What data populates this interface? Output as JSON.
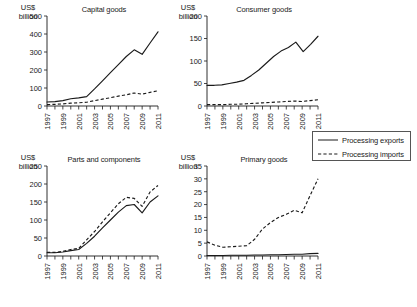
{
  "figure": {
    "unit_label": "US$\nbillion",
    "legend": {
      "exports_label": "Processing exports",
      "imports_label": "Processing imports",
      "exports_style": "solid",
      "imports_style": "dashed",
      "position": "right-middle"
    },
    "line_color": "#1a1a1a",
    "background": "#ffffff"
  },
  "chart_data": [
    {
      "type": "line",
      "title": "Capital goods",
      "xlabel": "",
      "ylabel": "US$ billion",
      "x": [
        1997,
        1998,
        1999,
        2000,
        2001,
        2002,
        2003,
        2004,
        2005,
        2006,
        2007,
        2008,
        2009,
        2010,
        2011
      ],
      "xtick_labels": [
        "1997",
        "1999",
        "2001",
        "2003",
        "2005",
        "2007",
        "2009",
        "2011"
      ],
      "xlim": [
        1997,
        2011
      ],
      "ylim": [
        0,
        500
      ],
      "yticks": [
        0,
        100,
        200,
        300,
        400,
        500
      ],
      "grid": false,
      "series": [
        {
          "name": "Processing exports",
          "style": "solid",
          "values": [
            22,
            24,
            30,
            40,
            45,
            52,
            95,
            140,
            185,
            230,
            275,
            312,
            287,
            350,
            412
          ]
        },
        {
          "name": "Processing imports",
          "style": "dashed",
          "values": [
            8,
            9,
            12,
            16,
            18,
            21,
            30,
            38,
            46,
            55,
            62,
            72,
            66,
            76,
            85
          ]
        }
      ]
    },
    {
      "type": "line",
      "title": "Consumer goods",
      "xlabel": "",
      "ylabel": "US$ billion",
      "x": [
        1997,
        1998,
        1999,
        2000,
        2001,
        2002,
        2003,
        2004,
        2005,
        2006,
        2007,
        2008,
        2009,
        2010,
        2011
      ],
      "xtick_labels": [
        "1997",
        "1999",
        "2001",
        "2003",
        "2005",
        "2007",
        "2009",
        "2011"
      ],
      "xlim": [
        1997,
        2011
      ],
      "ylim": [
        0,
        200
      ],
      "yticks": [
        0,
        50,
        100,
        150,
        200
      ],
      "grid": false,
      "series": [
        {
          "name": "Processing exports",
          "style": "solid",
          "values": [
            46,
            46,
            47,
            50,
            53,
            57,
            68,
            80,
            95,
            110,
            122,
            130,
            142,
            121,
            137,
            155
          ]
        },
        {
          "name": "Processing imports",
          "style": "dashed",
          "values": [
            3,
            3,
            3,
            4,
            4,
            5,
            6,
            7,
            8,
            9,
            10,
            11,
            10,
            12,
            14
          ]
        }
      ]
    },
    {
      "type": "line",
      "title": "Parts and components",
      "xlabel": "",
      "ylabel": "US$ billion",
      "x": [
        1997,
        1998,
        1999,
        2000,
        2001,
        2002,
        2003,
        2004,
        2005,
        2006,
        2007,
        2008,
        2009,
        2010,
        2011
      ],
      "xtick_labels": [
        "1997",
        "1999",
        "2001",
        "2003",
        "2005",
        "2007",
        "2009",
        "2011"
      ],
      "xlim": [
        1997,
        2011
      ],
      "ylim": [
        0,
        250
      ],
      "yticks": [
        0,
        50,
        100,
        150,
        200,
        250
      ],
      "grid": false,
      "series": [
        {
          "name": "Processing exports",
          "style": "solid",
          "values": [
            9,
            9,
            11,
            15,
            18,
            35,
            55,
            78,
            100,
            122,
            140,
            143,
            120,
            150,
            167
          ]
        },
        {
          "name": "Processing imports",
          "style": "dashed",
          "values": [
            10,
            10,
            13,
            18,
            21,
            45,
            68,
            95,
            120,
            145,
            163,
            160,
            138,
            178,
            196
          ]
        }
      ]
    },
    {
      "type": "line",
      "title": "Primary goods",
      "xlabel": "",
      "ylabel": "US$ billion",
      "x": [
        1997,
        1998,
        1999,
        2000,
        2001,
        2002,
        2003,
        2004,
        2005,
        2006,
        2007,
        2008,
        2009,
        2010,
        2011
      ],
      "xtick_labels": [
        "1997",
        "1999",
        "2001",
        "2003",
        "2005",
        "2007",
        "2009",
        "2011"
      ],
      "xlim": [
        1997,
        2011
      ],
      "ylim": [
        0,
        35
      ],
      "yticks": [
        0,
        5,
        10,
        15,
        20,
        25,
        30,
        35
      ],
      "grid": false,
      "series": [
        {
          "name": "Processing exports",
          "style": "solid",
          "values": [
            0.2,
            0.2,
            0.2,
            0.3,
            0.3,
            0.3,
            0.4,
            0.4,
            0.5,
            0.5,
            0.6,
            0.7,
            0.7,
            0.9,
            1.0
          ]
        },
        {
          "name": "Processing imports",
          "style": "dashed",
          "values": [
            5.5,
            4.2,
            3.4,
            3.6,
            3.8,
            4.0,
            6.5,
            10.5,
            13.0,
            15.0,
            16.2,
            17.8,
            16.8,
            23.5,
            30.0
          ]
        }
      ]
    }
  ]
}
